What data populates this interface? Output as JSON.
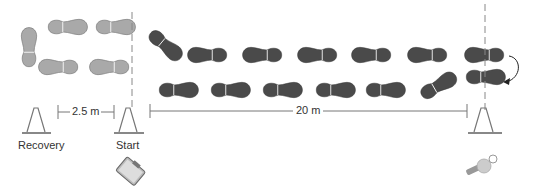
{
  "diagram": {
    "labels": {
      "recovery": "Recovery",
      "start": "Start",
      "recovery_distance": "2.5 m",
      "run_distance": "20 m"
    },
    "colors": {
      "recovery_footprint": "#a9a9a9",
      "run_footprint": "#4a4a4a",
      "line": "#777777",
      "text": "#333333"
    },
    "icons": [
      "cone-icon",
      "clipboard-icon",
      "whistle-icon",
      "footprint-icon",
      "turn-arrow-icon"
    ]
  }
}
